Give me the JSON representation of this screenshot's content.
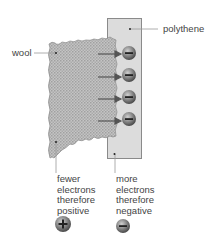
{
  "labels": {
    "wool": "wool",
    "polythene": "polythene"
  },
  "captions": {
    "wool": [
      "fewer",
      "electrons",
      "therefore",
      "positive"
    ],
    "polythene": [
      "more",
      "electrons",
      "therefore",
      "negative"
    ]
  },
  "symbols": {
    "positive": "+",
    "negative": "−"
  },
  "colors": {
    "polythene_fill": "#dcdcdc",
    "wool_fill": "#b5b5b5",
    "charge_fill": "#6a6a6a",
    "text": "#444444"
  }
}
